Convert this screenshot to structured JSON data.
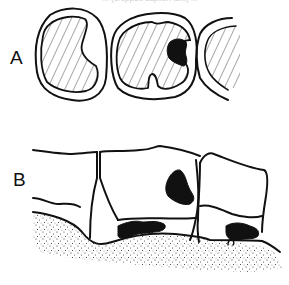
{
  "figure": {
    "caption_fragment": "... (cropped caption text) ...",
    "panels": [
      {
        "label": "A",
        "view": "occlusal view of three teeth",
        "description": "Hatched occlusal surfaces outlined; middle tooth shows a black carious lesion at its distal contact area"
      },
      {
        "label": "B",
        "view": "lateral view of teeth above dotted gingiva/bone",
        "description": "Crowns with black cervical/interproximal lesions near the gum line"
      }
    ],
    "colors": {
      "ink": "#111111",
      "background": "#ffffff"
    }
  }
}
